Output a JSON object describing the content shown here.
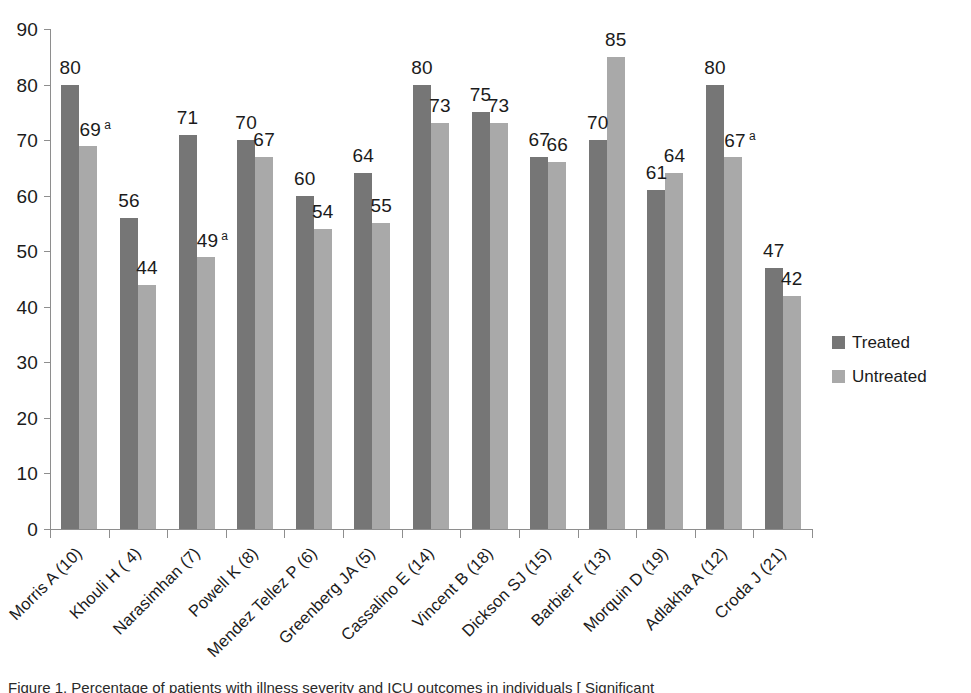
{
  "chart_data": {
    "type": "bar",
    "title": "",
    "xlabel": "",
    "ylabel": "",
    "ylim": [
      0,
      90
    ],
    "ytick_step": 10,
    "grid": false,
    "legend_position": "right",
    "yticks": [
      "90",
      "80",
      "70",
      "60",
      "50",
      "40",
      "30",
      "20",
      "10",
      "0"
    ],
    "categories": [
      "Morris A (10)",
      "Khouli H ( 4)",
      "Narasimhan (7)",
      "Powell K (8)",
      "Mendez Tellez P (6)",
      "Greenberg JA (5)",
      "Cassalino E (14)",
      "Vincent B (18)",
      "Dickson SJ (15)",
      "Barbier F (13)",
      "Morquin D (19)",
      "Adlakha A (12)",
      "Croda J (21)"
    ],
    "series": [
      {
        "name": "Treated",
        "color": "#767676",
        "values": [
          80,
          56,
          71,
          70,
          60,
          64,
          80,
          75,
          67,
          70,
          61,
          80,
          47
        ],
        "labels": [
          "80",
          "56",
          "71",
          "70",
          "60",
          "64",
          "80",
          "75",
          "67",
          "70",
          "61",
          "80",
          "47"
        ],
        "footnotes": [
          "",
          "",
          "",
          "",
          "",
          "",
          "",
          "",
          "",
          "",
          "",
          "",
          ""
        ]
      },
      {
        "name": "Untreated",
        "color": "#a9a9a9",
        "values": [
          69,
          44,
          49,
          67,
          54,
          55,
          73,
          73,
          66,
          85,
          64,
          67,
          42
        ],
        "labels": [
          "69",
          "44",
          "49",
          "67",
          "54",
          "55",
          "73",
          "73",
          "66",
          "85",
          "64",
          "67",
          "42"
        ],
        "footnotes": [
          "a",
          "",
          "a",
          "",
          "",
          "",
          "",
          "",
          "",
          "",
          "",
          "a",
          ""
        ]
      }
    ]
  },
  "legend": {
    "items": [
      {
        "label": "Treated",
        "swatch": "treated"
      },
      {
        "label": "Untreated",
        "swatch": "untreated"
      }
    ]
  },
  "caption": {
    "text": "Figure 1. Percentage of patients with illness severity and ICU outcomes in individuals [ Significant"
  }
}
